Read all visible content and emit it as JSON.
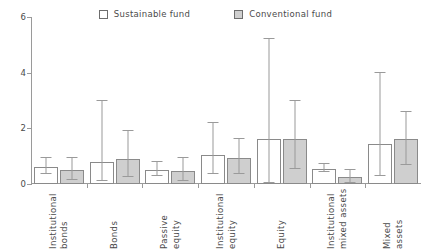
{
  "legend": {
    "entries": [
      {
        "label": "Sustainable fund",
        "swatch": "white-square-icon",
        "color": "#ffffff"
      },
      {
        "label": "Conventional fund",
        "swatch": "gray-square-icon",
        "color": "#cfcfcf"
      }
    ]
  },
  "axis": {
    "y_ticks": [
      "0",
      "2",
      "4",
      "6"
    ]
  },
  "chart_data": {
    "type": "bar",
    "title": "",
    "subtitle": "",
    "xlabel": "",
    "ylabel": "",
    "ylim": [
      0,
      6
    ],
    "ytick_values": [
      0,
      2,
      4,
      6
    ],
    "grid": false,
    "legend_position": "top-center",
    "error_bars": true,
    "categories": [
      "Institutional bonds",
      "Bonds",
      "Passive equity",
      "Institutional equity",
      "Equity",
      "Institutional mixed assets",
      "Mixed assets"
    ],
    "category_lines": [
      [
        "Institutional",
        "bonds"
      ],
      [
        "Bonds",
        ""
      ],
      [
        "Passive",
        "equity"
      ],
      [
        "Institutional",
        "equity"
      ],
      [
        "Equity",
        ""
      ],
      [
        "Institutional",
        "mixed assets"
      ],
      [
        "Mixed",
        "assets"
      ]
    ],
    "series": [
      {
        "name": "Sustainable fund",
        "color": "#ffffff",
        "values": [
          0.6,
          0.8,
          0.5,
          1.05,
          1.6,
          0.55,
          1.45
        ],
        "err_low": [
          0.35,
          0.1,
          0.3,
          0.35,
          0.05,
          0.42,
          0.3
        ],
        "err_high": [
          0.95,
          3.0,
          0.8,
          2.2,
          5.2,
          0.72,
          4.0
        ]
      },
      {
        "name": "Conventional fund",
        "color": "#cfcfcf",
        "values": [
          0.5,
          0.9,
          0.45,
          0.95,
          1.6,
          0.25,
          1.6
        ],
        "err_low": [
          0.15,
          0.25,
          0.12,
          0.35,
          0.55,
          0.05,
          0.7
        ],
        "err_high": [
          0.95,
          1.9,
          0.95,
          1.6,
          3.0,
          0.5,
          2.6
        ]
      }
    ]
  }
}
